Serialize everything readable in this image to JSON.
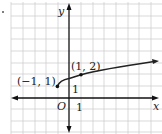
{
  "figure": {
    "type": "function-graph",
    "function": "y = sqrt((x+1)/2) + 1",
    "axes": {
      "x_label": "x",
      "y_label": "y",
      "origin_label": "O",
      "x_tick_label": "1",
      "y_tick_label": "1"
    },
    "points": [
      {
        "label": "(−1, 1)",
        "x": -1,
        "y": 1
      },
      {
        "label": "(1, 2)",
        "x": 1,
        "y": 2
      }
    ],
    "grid": {
      "x_range": [
        -5,
        8
      ],
      "y_range": [
        -3,
        8
      ],
      "unit": 1
    },
    "colors": {
      "grid": "#c8c8c8",
      "axis": "#111111",
      "curve": "#222222"
    }
  }
}
